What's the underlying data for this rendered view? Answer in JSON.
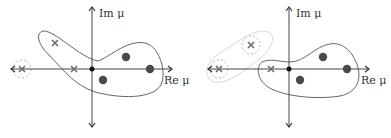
{
  "colors": {
    "axis": "#444444",
    "cross": "#6a6a6a",
    "dot": "#4a4a4a",
    "contour": "#555555",
    "faded_contour": "#c8c8c8",
    "dashed": "#aaaaaa"
  },
  "panels": [
    {
      "name": "left-panel",
      "im_label": "Im μ",
      "re_label": "Re μ",
      "crosses": [
        [
          22,
          69
        ],
        [
          55,
          43
        ],
        [
          74,
          69
        ]
      ],
      "dots": [
        [
          126,
          57
        ],
        [
          150,
          69
        ],
        [
          103,
          80
        ]
      ],
      "origin": [
        92,
        69
      ]
    },
    {
      "name": "right-panel",
      "im_label": "Im μ",
      "re_label": "Re μ",
      "crosses": [
        [
          219,
          69
        ],
        [
          251,
          45
        ],
        [
          271,
          69
        ]
      ],
      "dots": [
        [
          323,
          57
        ],
        [
          347,
          69
        ],
        [
          300,
          80
        ]
      ],
      "origin": [
        289,
        69
      ]
    }
  ]
}
